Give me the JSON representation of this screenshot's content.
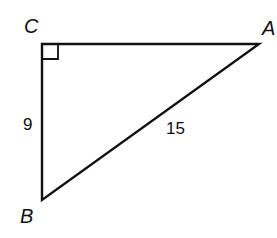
{
  "diagram": {
    "type": "right-triangle",
    "vertices": {
      "C": {
        "label": "C",
        "note": "right angle"
      },
      "A": {
        "label": "A"
      },
      "B": {
        "label": "B"
      }
    },
    "sides": {
      "CB": {
        "label": "9"
      },
      "AB": {
        "label": "15"
      },
      "CA": {
        "label": ""
      }
    },
    "line_color": "#111111"
  }
}
